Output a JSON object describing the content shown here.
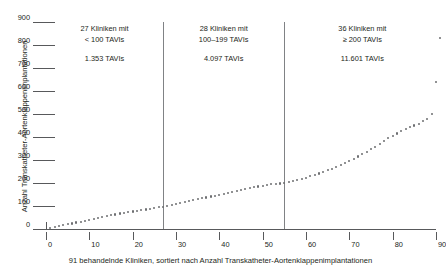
{
  "chart_data": {
    "type": "scatter",
    "title": "",
    "xlabel": "91 behandelnde Kliniken, sortiert nach Anzahl Transkatheter-Aortenklappenimplantationen",
    "ylabel": "Anzahl Transkatheter-Aortenklappenimplantationen",
    "xlim": [
      0,
      91
    ],
    "ylim": [
      0,
      900
    ],
    "xticks": [
      0,
      10,
      20,
      30,
      40,
      50,
      60,
      70,
      80,
      90
    ],
    "yticks": [
      0,
      100,
      200,
      300,
      400,
      500,
      600,
      700,
      800,
      900
    ],
    "grid": false,
    "legend": null,
    "x": [
      1,
      2,
      3,
      4,
      5,
      6,
      7,
      8,
      9,
      10,
      11,
      12,
      13,
      14,
      15,
      16,
      17,
      18,
      19,
      20,
      21,
      22,
      23,
      24,
      25,
      26,
      27,
      28,
      29,
      30,
      31,
      32,
      33,
      34,
      35,
      36,
      37,
      38,
      39,
      40,
      41,
      42,
      43,
      44,
      45,
      46,
      47,
      48,
      49,
      50,
      51,
      52,
      53,
      54,
      55,
      56,
      57,
      58,
      59,
      60,
      61,
      62,
      63,
      64,
      65,
      66,
      67,
      68,
      69,
      70,
      71,
      72,
      73,
      74,
      75,
      76,
      77,
      78,
      79,
      80,
      81,
      82,
      83,
      84,
      85,
      86,
      87,
      88,
      89,
      90,
      91
    ],
    "values": [
      4,
      8,
      12,
      16,
      20,
      24,
      28,
      32,
      36,
      40,
      44,
      48,
      52,
      56,
      60,
      63,
      67,
      70,
      73,
      76,
      79,
      82,
      85,
      88,
      91,
      94,
      97,
      101,
      105,
      109,
      113,
      117,
      121,
      125,
      129,
      133,
      137,
      141,
      145,
      149,
      153,
      157,
      161,
      165,
      169,
      173,
      177,
      181,
      185,
      188,
      191,
      194,
      196,
      198,
      199,
      203,
      208,
      213,
      218,
      223,
      229,
      235,
      241,
      248,
      255,
      262,
      270,
      278,
      287,
      296,
      305,
      315,
      325,
      336,
      347,
      358,
      370,
      382,
      394,
      405,
      415,
      425,
      435,
      443,
      450,
      458,
      468,
      480,
      500,
      640,
      830
    ],
    "annotations": [
      {
        "group": 1,
        "line1": "27 Kliniken mit",
        "line2": "< 100 TAVIs",
        "line3": "1.353 TAVIs",
        "x_center": 13.5
      },
      {
        "group": 2,
        "line1": "28 Kliniken mit",
        "line2": "100–199 TAVIs",
        "line3": "4.097 TAVIs",
        "x_center": 41
      },
      {
        "group": 3,
        "line1": "36 Kliniken mit",
        "line2": "≥ 200 TAVIs",
        "line3": "11.601 TAVIs",
        "x_center": 73
      }
    ],
    "dividers": [
      27,
      55
    ],
    "colors": {
      "point": "#6d6e71",
      "axis": "#58595b",
      "divider": "#808285",
      "text": "#231f20",
      "background": "#ffffff"
    }
  }
}
